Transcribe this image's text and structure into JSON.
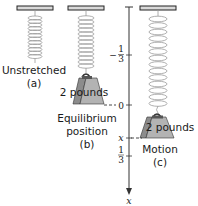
{
  "colors": {
    "bar_fill": "#d9d9d9",
    "bar_stroke": "#222222",
    "spring": "#9a9a9a",
    "weight_fill": "#b3b3b3",
    "weight_side": "#8c8c8c",
    "axis": "#333333"
  },
  "panels": [
    {
      "id": "a",
      "caption_lines": [
        "Unstretched",
        "(a)"
      ]
    },
    {
      "id": "b",
      "weight_label": "2 pounds",
      "caption_lines": [
        "Equilibrium",
        "position",
        "(b)"
      ]
    },
    {
      "id": "c",
      "weight_label": "2 pounds",
      "caption_lines": [
        "Motion",
        "(c)"
      ]
    }
  ],
  "axis": {
    "label": "x",
    "ticks": [
      {
        "label_num": "1",
        "label_den": "3",
        "sign": "−",
        "position": "-1/3"
      },
      {
        "label": "0",
        "position": "0"
      },
      {
        "label": "x",
        "position": "x"
      },
      {
        "label_num": "1",
        "label_den": "3",
        "sign": "",
        "position": "1/3"
      }
    ]
  }
}
